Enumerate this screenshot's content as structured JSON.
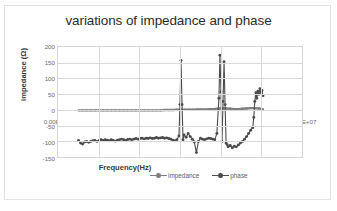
{
  "chart_data": {
    "type": "line",
    "title": "variations of impedance and phase",
    "xlabel": "Frequency(Hz)",
    "ylabel": "impedance (Ω)",
    "xlim": [
      0,
      12000000
    ],
    "ylim": [
      -150,
      200
    ],
    "grid": true,
    "legend_position": "bottom",
    "xticks": [
      "0.00E+00",
      "2.00E+06",
      "4.00E+06",
      "6.00E+06",
      "8.00E+06",
      "1.00E+07",
      "1.20E+07"
    ],
    "xtick_values": [
      0,
      2000000,
      4000000,
      6000000,
      8000000,
      10000000,
      12000000
    ],
    "yticks": [
      "200",
      "150",
      "100",
      "50",
      "0",
      "-50",
      "-100",
      "-150"
    ],
    "ytick_values": [
      200,
      150,
      100,
      50,
      0,
      -50,
      -100,
      -150
    ],
    "colors": {
      "impedance": "#7f7f7f",
      "phase": "#4a4a4a",
      "gridline": "#d9d9d9",
      "axis_text": "#6a6a6a",
      "title_text": "#2b2b2b"
    },
    "series": [
      {
        "name": "impedance",
        "color": "#7f7f7f",
        "x": [
          1000000,
          1200000,
          1400000,
          1600000,
          1800000,
          2000000,
          2200000,
          2400000,
          2600000,
          2800000,
          3000000,
          3200000,
          3400000,
          3600000,
          3800000,
          4000000,
          4200000,
          4400000,
          4600000,
          4800000,
          5000000,
          5200000,
          5400000,
          5600000,
          5800000,
          6000000,
          6200000,
          6400000,
          6600000,
          6800000,
          7000000,
          7200000,
          7400000,
          7600000,
          7800000,
          8000000,
          8200000,
          8400000,
          8600000,
          8800000,
          9000000,
          9200000,
          9400000,
          9600000,
          9800000,
          10000000
        ],
        "y": [
          2,
          2,
          2,
          2,
          2,
          2,
          2,
          2,
          2,
          2,
          2,
          2,
          2,
          2,
          2,
          2,
          2,
          2,
          2,
          2,
          2,
          3,
          3,
          3,
          4,
          4,
          4,
          4,
          4,
          5,
          5,
          5,
          6,
          6,
          7,
          8,
          8,
          7,
          6,
          6,
          7,
          8,
          9,
          9,
          8,
          5
        ]
      },
      {
        "name": "phase",
        "color": "#4a4a4a",
        "x": [
          1000000,
          1100000,
          1200000,
          1300000,
          1400000,
          1500000,
          1600000,
          1700000,
          1800000,
          1900000,
          2000000,
          2100000,
          2200000,
          2300000,
          2400000,
          2500000,
          2600000,
          2700000,
          2800000,
          2900000,
          3000000,
          3100000,
          3200000,
          3300000,
          3400000,
          3500000,
          3600000,
          3700000,
          3800000,
          3900000,
          4000000,
          4100000,
          4200000,
          4300000,
          4400000,
          4500000,
          4600000,
          4700000,
          4800000,
          4900000,
          5000000,
          5100000,
          5200000,
          5300000,
          5400000,
          5500000,
          5600000,
          5700000,
          5800000,
          5900000,
          5950000,
          6000000,
          6050000,
          6100000,
          6150000,
          6250000,
          6350000,
          6450000,
          6550000,
          6650000,
          6750000,
          6850000,
          6950000,
          7050000,
          7150000,
          7250000,
          7350000,
          7450000,
          7550000,
          7650000,
          7750000,
          7850000,
          7900000,
          7950000,
          8000000,
          8050000,
          8100000,
          8150000,
          8200000,
          8250000,
          8300000,
          8400000,
          8500000,
          8600000,
          8700000,
          8800000,
          8900000,
          9000000,
          9100000,
          9200000,
          9300000,
          9400000,
          9500000,
          9550000,
          9600000,
          9650000,
          9700000,
          9750000,
          9800000,
          9850000,
          9900000,
          9950000,
          10000000
        ],
        "y": [
          -92,
          -100,
          -103,
          -97,
          -95,
          -98,
          -95,
          -93,
          -92,
          -95,
          -93,
          -90,
          -92,
          -90,
          -91,
          -93,
          -90,
          -92,
          -94,
          -91,
          -90,
          -88,
          -90,
          -92,
          -89,
          -88,
          -90,
          -88,
          -86,
          -88,
          -86,
          -85,
          -87,
          -85,
          -86,
          -84,
          -86,
          -85,
          -83,
          -85,
          -84,
          -83,
          -85,
          -84,
          -86,
          -88,
          -91,
          -93,
          -90,
          -78,
          20,
          158,
          20,
          -90,
          -75,
          -82,
          -70,
          -80,
          -88,
          -97,
          -130,
          -95,
          -85,
          -88,
          -90,
          -87,
          -85,
          -86,
          -88,
          -90,
          -70,
          40,
          174,
          60,
          -95,
          30,
          154,
          20,
          -100,
          -105,
          -112,
          -108,
          -115,
          -110,
          -112,
          -106,
          -100,
          -95,
          -88,
          -80,
          -70,
          -60,
          -52,
          -20,
          30,
          57,
          40,
          62,
          52,
          70,
          58,
          64,
          48
        ]
      }
    ]
  }
}
